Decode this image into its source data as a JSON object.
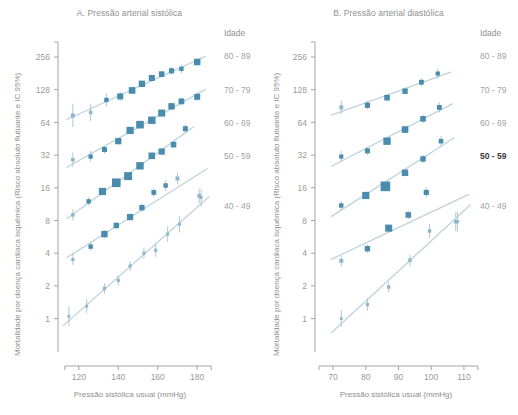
{
  "figure": {
    "axis_color": "#9a9a9a",
    "marker_color": "#4a8cab",
    "marker_color_faint": "#8fb7c9",
    "trend_color": "#bcd4de",
    "legend_title": "Idade"
  },
  "panels": [
    {
      "id": "A",
      "title": "A. Pressão arterial sistólica",
      "xlabel": "Pressão sistólica usual (mmHg)",
      "ylabel": "Mortalidade por doença cardíaca isquêmica (Risco absoluto flutuante e IC 95%)",
      "xticks": [
        120,
        140,
        160,
        180
      ],
      "yticks": [
        256,
        128,
        64,
        32,
        16,
        8,
        4,
        2,
        1
      ],
      "legend": [
        {
          "label": "80 - 89",
          "bold": false
        },
        {
          "label": "70 - 79",
          "bold": false
        },
        {
          "label": "60 - 69",
          "bold": false
        },
        {
          "label": "50 - 59",
          "bold": false
        },
        {
          "label": "40 - 49",
          "bold": false
        }
      ]
    },
    {
      "id": "B",
      "title": "B. Pressão arterial diastólica",
      "xlabel": "Pressão sistólica usual (mmHg)",
      "ylabel": "Mortalidade por doença cardíaca isquêmica (Risco absoluto flutuante e IC 95%)",
      "xticks": [
        70,
        80,
        90,
        100,
        110
      ],
      "yticks": [
        256,
        128,
        64,
        32,
        16,
        8,
        4,
        2,
        1
      ],
      "legend": [
        {
          "label": "80 - 89",
          "bold": false
        },
        {
          "label": "70 - 79",
          "bold": false
        },
        {
          "label": "60 - 69",
          "bold": false
        },
        {
          "label": "50 - 59",
          "bold": true
        },
        {
          "label": "40 - 49",
          "bold": false
        }
      ]
    }
  ],
  "chart_data": [
    {
      "type": "scatter",
      "panel": "A",
      "title": "A. Pressão arterial sistólica",
      "xlabel": "Pressão sistólica usual (mmHg)",
      "ylabel": "Mortalidade por doença cardíaca isquêmica (Risco absoluto flutuante e IC 95%)",
      "xlim": [
        112,
        188
      ],
      "ylim": [
        0.75,
        330
      ],
      "yscale": "log2",
      "xticks": [
        120,
        140,
        160,
        180
      ],
      "yticks": [
        256,
        128,
        64,
        32,
        16,
        8,
        4,
        2,
        1
      ],
      "grid": false,
      "legend_position": "right",
      "legend_title": "Idade",
      "series": [
        {
          "name": "80 - 89",
          "points": [
            {
              "x": 117,
              "y": 74,
              "size": 4.0,
              "lo": 58,
              "hi": 95
            },
            {
              "x": 126,
              "y": 79,
              "size": 3.6,
              "lo": 66,
              "hi": 95
            },
            {
              "x": 134,
              "y": 103,
              "size": 4.4,
              "lo": 90,
              "hi": 118
            },
            {
              "x": 141,
              "y": 111,
              "size": 6.0,
              "lo": 101,
              "hi": 122
            },
            {
              "x": 147,
              "y": 126,
              "size": 6.6,
              "lo": 117,
              "hi": 136
            },
            {
              "x": 152,
              "y": 145,
              "size": 6.4,
              "lo": 136,
              "hi": 155
            },
            {
              "x": 157,
              "y": 164,
              "size": 6.0,
              "lo": 153,
              "hi": 176
            },
            {
              "x": 162,
              "y": 178,
              "size": 5.6,
              "lo": 165,
              "hi": 192
            },
            {
              "x": 167,
              "y": 191,
              "size": 5.2,
              "lo": 176,
              "hi": 207
            },
            {
              "x": 172,
              "y": 199,
              "size": 4.4,
              "lo": 182,
              "hi": 218
            },
            {
              "x": 180,
              "y": 230,
              "size": 6.4,
              "lo": 212,
              "hi": 250
            }
          ]
        },
        {
          "name": "70 - 79",
          "points": [
            {
              "x": 117,
              "y": 29,
              "size": 3.6,
              "lo": 25,
              "hi": 34
            },
            {
              "x": 126,
              "y": 31,
              "size": 4.2,
              "lo": 28,
              "hi": 35
            },
            {
              "x": 133,
              "y": 36,
              "size": 5.0,
              "lo": 33,
              "hi": 39
            },
            {
              "x": 140,
              "y": 43,
              "size": 6.2,
              "lo": 40,
              "hi": 46
            },
            {
              "x": 146,
              "y": 54,
              "size": 7.2,
              "lo": 51,
              "hi": 58
            },
            {
              "x": 151,
              "y": 61,
              "size": 7.6,
              "lo": 57,
              "hi": 65
            },
            {
              "x": 157,
              "y": 67,
              "size": 7.4,
              "lo": 63,
              "hi": 72
            },
            {
              "x": 162,
              "y": 78,
              "size": 7.0,
              "lo": 73,
              "hi": 84
            },
            {
              "x": 167,
              "y": 90,
              "size": 6.4,
              "lo": 83,
              "hi": 97
            },
            {
              "x": 172,
              "y": 100,
              "size": 5.8,
              "lo": 92,
              "hi": 109
            },
            {
              "x": 180,
              "y": 110,
              "size": 6.0,
              "lo": 101,
              "hi": 120
            }
          ]
        },
        {
          "name": "60 - 69",
          "points": [
            {
              "x": 117,
              "y": 9.0,
              "size": 3.4,
              "lo": 8.0,
              "hi": 10.2
            },
            {
              "x": 125,
              "y": 12.0,
              "size": 4.4,
              "lo": 11.0,
              "hi": 13.1
            },
            {
              "x": 132,
              "y": 14.8,
              "size": 7.2,
              "lo": 13.8,
              "hi": 15.9
            },
            {
              "x": 139,
              "y": 17.8,
              "size": 8.6,
              "lo": 16.8,
              "hi": 18.9
            },
            {
              "x": 145,
              "y": 20.5,
              "size": 8.0,
              "lo": 19.3,
              "hi": 21.8
            },
            {
              "x": 151,
              "y": 25.5,
              "size": 7.4,
              "lo": 24.0,
              "hi": 27.1
            },
            {
              "x": 157,
              "y": 31.5,
              "size": 6.6,
              "lo": 29.5,
              "hi": 33.6
            },
            {
              "x": 162,
              "y": 34.5,
              "size": 6.2,
              "lo": 32.0,
              "hi": 37.2
            },
            {
              "x": 168,
              "y": 40.0,
              "size": 5.6,
              "lo": 37.0,
              "hi": 43.3
            },
            {
              "x": 174,
              "y": 56.0,
              "size": 5.0,
              "lo": 51.0,
              "hi": 61.5
            }
          ]
        },
        {
          "name": "50 - 59",
          "points": [
            {
              "x": 117,
              "y": 3.5,
              "size": 3.2,
              "lo": 3.1,
              "hi": 4.0
            },
            {
              "x": 126,
              "y": 4.6,
              "size": 4.4,
              "lo": 4.2,
              "hi": 5.1
            },
            {
              "x": 133,
              "y": 6.0,
              "size": 6.4,
              "lo": 5.5,
              "hi": 6.5
            },
            {
              "x": 139,
              "y": 7.2,
              "size": 5.4,
              "lo": 6.7,
              "hi": 7.8
            },
            {
              "x": 146,
              "y": 8.6,
              "size": 6.2,
              "lo": 8.0,
              "hi": 9.3
            },
            {
              "x": 152,
              "y": 10.5,
              "size": 5.4,
              "lo": 9.6,
              "hi": 11.5
            },
            {
              "x": 158,
              "y": 14.5,
              "size": 4.8,
              "lo": 13.2,
              "hi": 16.0
            },
            {
              "x": 164,
              "y": 16.8,
              "size": 4.4,
              "lo": 15.0,
              "hi": 18.8
            },
            {
              "x": 170,
              "y": 19.5,
              "size": 4.0,
              "lo": 17.2,
              "hi": 22.1
            },
            {
              "x": 181,
              "y": 13.5,
              "size": 3.6,
              "lo": 11.5,
              "hi": 15.8
            }
          ]
        },
        {
          "name": "40 - 49",
          "points": [
            {
              "x": 115,
              "y": 1.05,
              "size": 2.8,
              "lo": 0.85,
              "hi": 1.3
            },
            {
              "x": 124,
              "y": 1.3,
              "size": 3.0,
              "lo": 1.12,
              "hi": 1.52
            },
            {
              "x": 133,
              "y": 1.9,
              "size": 3.2,
              "lo": 1.7,
              "hi": 2.12
            },
            {
              "x": 140,
              "y": 2.25,
              "size": 3.2,
              "lo": 2.02,
              "hi": 2.5
            },
            {
              "x": 146,
              "y": 3.05,
              "size": 3.2,
              "lo": 2.75,
              "hi": 3.38
            },
            {
              "x": 153,
              "y": 4.0,
              "size": 3.2,
              "lo": 3.55,
              "hi": 4.5
            },
            {
              "x": 159,
              "y": 4.25,
              "size": 3.2,
              "lo": 3.7,
              "hi": 4.9
            },
            {
              "x": 165,
              "y": 6.0,
              "size": 3.0,
              "lo": 5.1,
              "hi": 7.05
            },
            {
              "x": 171,
              "y": 7.4,
              "size": 3.0,
              "lo": 6.2,
              "hi": 8.8
            },
            {
              "x": 182,
              "y": 13.0,
              "size": 3.0,
              "lo": 10.8,
              "hi": 15.6
            }
          ]
        }
      ]
    },
    {
      "type": "scatter",
      "panel": "B",
      "title": "B. Pressão arterial diastólica",
      "xlabel": "Pressão sistólica usual (mmHg)",
      "ylabel": "Mortalidade por doença cardíaca isquêmica (Risco absoluto flutuante e IC 95%)",
      "xlim": [
        66,
        114
      ],
      "ylim": [
        0.75,
        330
      ],
      "yscale": "log2",
      "xticks": [
        70,
        80,
        90,
        100,
        110
      ],
      "yticks": [
        256,
        128,
        64,
        32,
        16,
        8,
        4,
        2,
        1
      ],
      "grid": false,
      "legend_position": "right",
      "legend_title": "Idade",
      "series": [
        {
          "name": "80 - 89",
          "points": [
            {
              "x": 72.5,
              "y": 88,
              "size": 4.0,
              "lo": 76,
              "hi": 102
            },
            {
              "x": 80.5,
              "y": 92,
              "size": 5.2,
              "lo": 84,
              "hi": 101
            },
            {
              "x": 86.5,
              "y": 108,
              "size": 5.6,
              "lo": 100,
              "hi": 117
            },
            {
              "x": 92.0,
              "y": 124,
              "size": 5.4,
              "lo": 115,
              "hi": 134
            },
            {
              "x": 97.0,
              "y": 150,
              "size": 4.8,
              "lo": 138,
              "hi": 163
            },
            {
              "x": 102.0,
              "y": 180,
              "size": 4.2,
              "lo": 162,
              "hi": 200
            }
          ]
        },
        {
          "name": "70 - 79",
          "points": [
            {
              "x": 72.5,
              "y": 31,
              "size": 4.2,
              "lo": 28,
              "hi": 35
            },
            {
              "x": 80.5,
              "y": 35,
              "size": 5.0,
              "lo": 32,
              "hi": 38
            },
            {
              "x": 86.5,
              "y": 43,
              "size": 7.4,
              "lo": 40,
              "hi": 46
            },
            {
              "x": 92.0,
              "y": 55,
              "size": 6.6,
              "lo": 51,
              "hi": 59
            },
            {
              "x": 97.5,
              "y": 69,
              "size": 5.6,
              "lo": 63,
              "hi": 75
            },
            {
              "x": 102.5,
              "y": 88,
              "size": 4.8,
              "lo": 79,
              "hi": 98
            }
          ]
        },
        {
          "name": "60 - 69",
          "points": [
            {
              "x": 72.5,
              "y": 11.0,
              "size": 4.4,
              "lo": 10.0,
              "hi": 12.1
            },
            {
              "x": 80.0,
              "y": 13.6,
              "size": 7.2,
              "lo": 12.7,
              "hi": 14.6
            },
            {
              "x": 86.0,
              "y": 16.5,
              "size": 9.6,
              "lo": 15.5,
              "hi": 17.6
            },
            {
              "x": 92.0,
              "y": 22.0,
              "size": 6.4,
              "lo": 20.3,
              "hi": 23.8
            },
            {
              "x": 97.5,
              "y": 29.5,
              "size": 5.4,
              "lo": 27.0,
              "hi": 32.2
            },
            {
              "x": 103.0,
              "y": 43.0,
              "size": 4.6,
              "lo": 38.5,
              "hi": 48.0
            }
          ]
        },
        {
          "name": "50 - 59",
          "points": [
            {
              "x": 72.5,
              "y": 3.4,
              "size": 4.0,
              "lo": 3.0,
              "hi": 3.8
            },
            {
              "x": 80.5,
              "y": 4.4,
              "size": 5.4,
              "lo": 4.0,
              "hi": 4.8
            },
            {
              "x": 87.0,
              "y": 6.8,
              "size": 7.0,
              "lo": 6.3,
              "hi": 7.4
            },
            {
              "x": 93.0,
              "y": 9.0,
              "size": 5.6,
              "lo": 8.2,
              "hi": 9.9
            },
            {
              "x": 98.5,
              "y": 14.5,
              "size": 5.2,
              "lo": 13.0,
              "hi": 16.2
            },
            {
              "x": 107.5,
              "y": 7.8,
              "size": 3.4,
              "lo": 6.4,
              "hi": 9.5
            }
          ]
        },
        {
          "name": "40 - 49",
          "points": [
            {
              "x": 72.5,
              "y": 1.0,
              "size": 2.8,
              "lo": 0.84,
              "hi": 1.2
            },
            {
              "x": 80.5,
              "y": 1.35,
              "size": 3.2,
              "lo": 1.18,
              "hi": 1.55
            },
            {
              "x": 87.0,
              "y": 1.95,
              "size": 3.4,
              "lo": 1.75,
              "hi": 2.18
            },
            {
              "x": 93.5,
              "y": 3.45,
              "size": 3.4,
              "lo": 3.05,
              "hi": 3.9
            },
            {
              "x": 99.5,
              "y": 6.4,
              "size": 3.4,
              "lo": 5.5,
              "hi": 7.45
            },
            {
              "x": 108.0,
              "y": 7.8,
              "size": 3.2,
              "lo": 6.3,
              "hi": 9.65
            }
          ]
        }
      ]
    }
  ]
}
